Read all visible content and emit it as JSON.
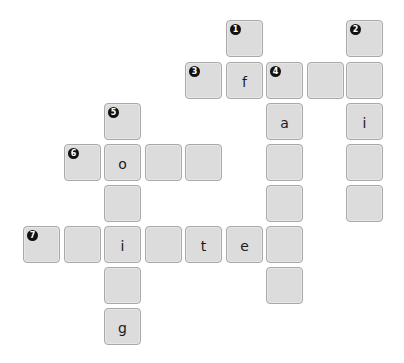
{
  "puzzle": {
    "type": "crossword",
    "grid": {
      "col_x": [
        23,
        64,
        104,
        145,
        185,
        226,
        266,
        307,
        346
      ],
      "row_y": [
        20,
        62,
        103,
        144,
        185,
        226,
        267,
        308
      ]
    },
    "colors": {
      "cell_fill": "#dcdcdc",
      "cell_border": "#a9a9a9",
      "badge_fill": "#111111",
      "badge_text": "#ffffff",
      "letter": "#1a1a1a"
    },
    "cells": [
      {
        "row": 0,
        "col": 5,
        "number": "1",
        "letter": ""
      },
      {
        "row": 0,
        "col": 8,
        "number": "2",
        "letter": ""
      },
      {
        "row": 1,
        "col": 4,
        "number": "3",
        "letter": ""
      },
      {
        "row": 1,
        "col": 5,
        "number": "",
        "letter": "f"
      },
      {
        "row": 1,
        "col": 6,
        "number": "4",
        "letter": ""
      },
      {
        "row": 1,
        "col": 7,
        "number": "",
        "letter": ""
      },
      {
        "row": 1,
        "col": 8,
        "number": "",
        "letter": ""
      },
      {
        "row": 2,
        "col": 2,
        "number": "5",
        "letter": ""
      },
      {
        "row": 2,
        "col": 6,
        "number": "",
        "letter": "a"
      },
      {
        "row": 2,
        "col": 8,
        "number": "",
        "letter": "i"
      },
      {
        "row": 3,
        "col": 1,
        "number": "6",
        "letter": ""
      },
      {
        "row": 3,
        "col": 2,
        "number": "",
        "letter": "o"
      },
      {
        "row": 3,
        "col": 3,
        "number": "",
        "letter": ""
      },
      {
        "row": 3,
        "col": 4,
        "number": "",
        "letter": ""
      },
      {
        "row": 3,
        "col": 6,
        "number": "",
        "letter": ""
      },
      {
        "row": 3,
        "col": 8,
        "number": "",
        "letter": ""
      },
      {
        "row": 4,
        "col": 2,
        "number": "",
        "letter": ""
      },
      {
        "row": 4,
        "col": 6,
        "number": "",
        "letter": ""
      },
      {
        "row": 4,
        "col": 8,
        "number": "",
        "letter": ""
      },
      {
        "row": 5,
        "col": 0,
        "number": "7",
        "letter": ""
      },
      {
        "row": 5,
        "col": 1,
        "number": "",
        "letter": ""
      },
      {
        "row": 5,
        "col": 2,
        "number": "",
        "letter": "i"
      },
      {
        "row": 5,
        "col": 3,
        "number": "",
        "letter": ""
      },
      {
        "row": 5,
        "col": 4,
        "number": "",
        "letter": "t"
      },
      {
        "row": 5,
        "col": 5,
        "number": "",
        "letter": "e"
      },
      {
        "row": 5,
        "col": 6,
        "number": "",
        "letter": ""
      },
      {
        "row": 6,
        "col": 2,
        "number": "",
        "letter": ""
      },
      {
        "row": 6,
        "col": 6,
        "number": "",
        "letter": ""
      },
      {
        "row": 7,
        "col": 2,
        "number": "",
        "letter": "g"
      }
    ]
  }
}
